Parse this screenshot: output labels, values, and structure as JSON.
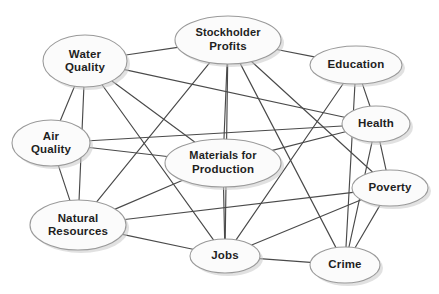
{
  "diagram": {
    "type": "concept-map",
    "background_color": "#ffffff",
    "node_fill_color": "#fbfbfb",
    "node_border_color": "#9a9a9a",
    "edge_color": "#4a4a4a",
    "label_color": "#1f1f1f",
    "nodes": [
      {
        "id": "water_quality",
        "label_lines": [
          "Water",
          "Quality"
        ],
        "cx": 85,
        "cy": 61,
        "rx": 42,
        "ry": 26
      },
      {
        "id": "stockholder",
        "label_lines": [
          "Stockholder",
          "Profits"
        ],
        "cx": 228,
        "cy": 40,
        "rx": 53,
        "ry": 24
      },
      {
        "id": "education",
        "label_lines": [
          "Education"
        ],
        "cx": 356,
        "cy": 65,
        "rx": 46,
        "ry": 19
      },
      {
        "id": "air_quality",
        "label_lines": [
          "Air",
          "Quality"
        ],
        "cx": 51,
        "cy": 143,
        "rx": 39,
        "ry": 23
      },
      {
        "id": "health",
        "label_lines": [
          "Health"
        ],
        "cx": 376,
        "cy": 124,
        "rx": 34,
        "ry": 18
      },
      {
        "id": "materials",
        "label_lines": [
          "Materials for",
          "Production"
        ],
        "cx": 223,
        "cy": 163,
        "rx": 58,
        "ry": 24
      },
      {
        "id": "poverty",
        "label_lines": [
          "Poverty"
        ],
        "cx": 390,
        "cy": 188,
        "rx": 38,
        "ry": 18
      },
      {
        "id": "natural",
        "label_lines": [
          "Natural",
          "Resources"
        ],
        "cx": 78,
        "cy": 225,
        "rx": 48,
        "ry": 25
      },
      {
        "id": "jobs",
        "label_lines": [
          "Jobs"
        ],
        "cx": 225,
        "cy": 256,
        "rx": 35,
        "ry": 17
      },
      {
        "id": "crime",
        "label_lines": [
          "Crime"
        ],
        "cx": 345,
        "cy": 265,
        "rx": 35,
        "ry": 18
      }
    ],
    "edges": [
      {
        "from": "water_quality",
        "to": "stockholder"
      },
      {
        "from": "water_quality",
        "to": "health"
      },
      {
        "from": "water_quality",
        "to": "materials"
      },
      {
        "from": "water_quality",
        "to": "air_quality"
      },
      {
        "from": "water_quality",
        "to": "natural"
      },
      {
        "from": "water_quality",
        "to": "jobs"
      },
      {
        "from": "stockholder",
        "to": "education"
      },
      {
        "from": "stockholder",
        "to": "natural"
      },
      {
        "from": "stockholder",
        "to": "materials"
      },
      {
        "from": "stockholder",
        "to": "jobs"
      },
      {
        "from": "stockholder",
        "to": "crime"
      },
      {
        "from": "stockholder",
        "to": "poverty"
      },
      {
        "from": "education",
        "to": "health"
      },
      {
        "from": "education",
        "to": "crime"
      },
      {
        "from": "education",
        "to": "jobs"
      },
      {
        "from": "air_quality",
        "to": "health"
      },
      {
        "from": "air_quality",
        "to": "materials"
      },
      {
        "from": "air_quality",
        "to": "natural"
      },
      {
        "from": "health",
        "to": "materials"
      },
      {
        "from": "health",
        "to": "crime"
      },
      {
        "from": "health",
        "to": "poverty"
      },
      {
        "from": "materials",
        "to": "natural"
      },
      {
        "from": "materials",
        "to": "jobs"
      },
      {
        "from": "natural",
        "to": "poverty"
      },
      {
        "from": "natural",
        "to": "jobs"
      },
      {
        "from": "poverty",
        "to": "crime"
      },
      {
        "from": "poverty",
        "to": "jobs"
      },
      {
        "from": "jobs",
        "to": "crime"
      }
    ]
  }
}
